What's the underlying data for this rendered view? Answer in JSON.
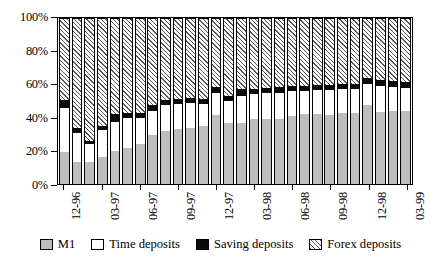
{
  "chart_data": {
    "type": "bar",
    "subtype": "stacked-percent-bar",
    "title": "",
    "xlabel": "",
    "ylabel": "",
    "ylim": [
      0,
      100
    ],
    "yticks": [
      0,
      20,
      40,
      60,
      80,
      100
    ],
    "ytick_labels": [
      "0%",
      "20%",
      "40%",
      "60%",
      "80%",
      "100%"
    ],
    "grid": false,
    "legend_position": "bottom",
    "stack_order_bottom_to_top": [
      "M1",
      "Time deposits",
      "Saving deposits",
      "Forex deposits"
    ],
    "categories": [
      "12-96",
      "01-97",
      "02-97",
      "03-97",
      "04-97",
      "05-97",
      "06-97",
      "07-97",
      "08-97",
      "09-97",
      "10-97",
      "11-97",
      "12-97",
      "01-98",
      "02-98",
      "03-98",
      "04-98",
      "05-98",
      "06-98",
      "07-98",
      "08-98",
      "09-98",
      "10-98",
      "11-98",
      "12-98",
      "01-99",
      "02-99",
      "03-99"
    ],
    "xtick_labels": [
      "12-96",
      "03-97",
      "06-97",
      "09-97",
      "12-97",
      "03-98",
      "06-98",
      "09-98",
      "12-98",
      "03-99"
    ],
    "xtick_category_index": [
      0,
      3,
      6,
      9,
      12,
      15,
      18,
      21,
      24,
      27
    ],
    "series": [
      {
        "name": "M1",
        "color": "#bdbdbd",
        "pattern": "solid",
        "values": [
          19.5,
          13.5,
          13.0,
          16.5,
          20.0,
          21.5,
          24.0,
          29.5,
          32.0,
          33.0,
          33.5,
          35.0,
          41.5,
          37.0,
          36.5,
          39.0,
          39.0,
          39.0,
          41.0,
          42.0,
          42.0,
          41.5,
          42.5,
          43.0,
          47.5,
          43.5,
          44.0,
          44.0
        ]
      },
      {
        "name": "Time deposits",
        "color": "#ffffff",
        "pattern": "solid",
        "values": [
          26.5,
          17.5,
          11.0,
          16.0,
          17.5,
          18.5,
          16.0,
          14.5,
          15.5,
          15.5,
          15.5,
          13.0,
          13.5,
          13.0,
          16.5,
          15.5,
          16.0,
          16.0,
          15.0,
          14.0,
          14.5,
          15.0,
          14.5,
          14.0,
          13.0,
          15.5,
          14.5,
          14.0
        ]
      },
      {
        "name": "Saving deposits",
        "color": "#0a0a0a",
        "pattern": "solid",
        "values": [
          4.5,
          3.0,
          2.0,
          2.5,
          4.5,
          3.0,
          2.5,
          3.5,
          3.0,
          3.0,
          3.0,
          3.5,
          3.5,
          3.0,
          4.5,
          3.0,
          3.0,
          3.5,
          3.0,
          3.0,
          3.0,
          3.0,
          3.0,
          3.0,
          3.5,
          3.5,
          3.5,
          3.5
        ]
      },
      {
        "name": "Forex deposits",
        "color": "#ffffff",
        "pattern": "diagonal-hatch",
        "values": [
          49.5,
          66.0,
          74.0,
          65.0,
          58.0,
          57.0,
          57.5,
          52.5,
          49.5,
          48.5,
          48.0,
          48.5,
          41.5,
          47.0,
          42.5,
          42.5,
          42.0,
          41.5,
          41.0,
          41.0,
          40.5,
          40.5,
          40.0,
          40.0,
          36.0,
          37.5,
          38.0,
          38.5
        ]
      }
    ]
  },
  "legend": {
    "items": [
      {
        "label": "M1",
        "swatch": "m1-swatch"
      },
      {
        "label": "Time deposits",
        "swatch": "time-deposits-swatch"
      },
      {
        "label": "Saving deposits",
        "swatch": "saving-deposits-swatch"
      },
      {
        "label": "Forex deposits",
        "swatch": "forex-deposits-swatch"
      }
    ]
  }
}
